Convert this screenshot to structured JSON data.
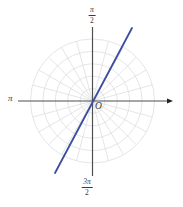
{
  "figure": {
    "colors": {
      "background": "#ffffff",
      "grid": "#d8dadd",
      "axis": "#4f4f4f",
      "arrow": "#222222",
      "line": "#3b4da0",
      "label": "#3a3a3a"
    },
    "labels": {
      "axis_left": "π",
      "axis_top_numerator": "π",
      "axis_top_denominator": "2",
      "axis_bottom_numerator": "3π",
      "axis_bottom_denominator": "2",
      "origin": "O"
    }
  },
  "chart_data": {
    "type": "line",
    "coordinate_system": "polar",
    "title": "",
    "xlabel": "",
    "ylabel": "",
    "center": {
      "x": 92.5,
      "y": 101
    },
    "grid": {
      "num_circles": 5,
      "max_radius": 62,
      "radial_line_step_degrees": 15,
      "grid_on": true
    },
    "axes": {
      "horizontal": {
        "x_start": 18,
        "x_end": 173,
        "arrowhead": "right"
      },
      "vertical": {
        "y_start": 27,
        "y_end": 176
      },
      "tick_labels": [
        "π/2",
        "π",
        "3π/2"
      ]
    },
    "plotted_line": {
      "description": "straight line through the pole O at angle θ ≈ π/3 (≈62°)",
      "angle_degrees": 62,
      "endpoints": [
        {
          "x": 55,
          "y": 173
        },
        {
          "x": 132,
          "y": 28
        }
      ]
    }
  }
}
